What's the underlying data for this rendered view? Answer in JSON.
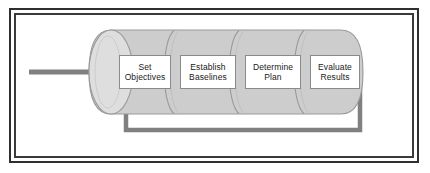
{
  "diagram": {
    "colors": {
      "frame_border": "#2f2f2f",
      "cylinder_fill": "#cdcdcd",
      "cylinder_cap_fill": "#dedede",
      "cylinder_stroke": "#9a9a9a",
      "arrow_gray": "#808080",
      "box_fill": "#ffffff",
      "box_stroke": "#8a8a8a",
      "text": "#1a1a1a",
      "background": "#ffffff"
    },
    "cylinder": {
      "name": "process-cylinder",
      "segment_count": 4
    },
    "steps": [
      {
        "id": "set-objectives",
        "line1": "Set",
        "line2": "Objectives"
      },
      {
        "id": "establish-baselines",
        "line1": "Establish",
        "line2": "Baselines"
      },
      {
        "id": "determine-plan",
        "line1": "Determine",
        "line2": "Plan"
      },
      {
        "id": "evaluate-results",
        "line1": "Evaluate",
        "line2": "Results"
      }
    ],
    "connectors": [
      {
        "id": "input-arrow",
        "label": "",
        "direction": "right",
        "description": "input arrow entering cylinder from left"
      },
      {
        "id": "feedback-loop",
        "label": "",
        "direction": "up",
        "description": "feedback loop from Evaluate Results back to Set Objectives"
      }
    ]
  }
}
